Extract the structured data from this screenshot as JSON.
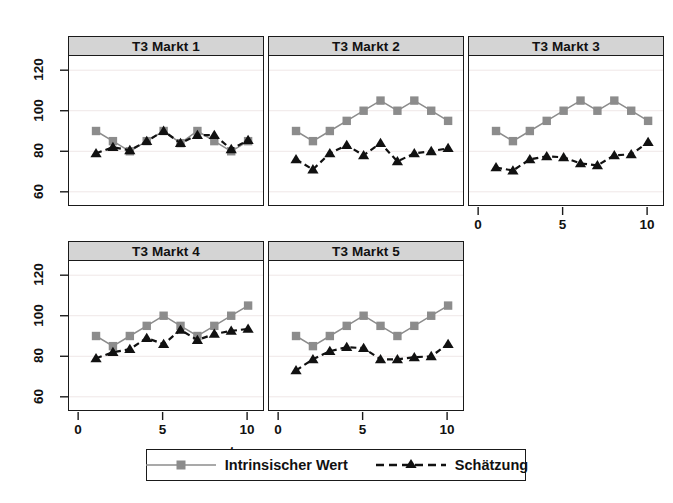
{
  "figure": {
    "xlabel": "t",
    "background": "#ffffff",
    "strip_fill": "#d4d4d4",
    "frame_color": "#1a1a1a"
  },
  "axis": {
    "y_ticks": [
      60,
      80,
      100,
      120
    ],
    "y_tick_labels": [
      "60",
      "80",
      "100",
      "120"
    ],
    "x_ticks": [
      0,
      5,
      10
    ],
    "x_tick_labels": [
      "0",
      "5",
      "10"
    ],
    "ylim": [
      53,
      127
    ],
    "xlim": [
      -0.6,
      11.0
    ]
  },
  "legend": {
    "items": [
      {
        "label": "Intrinsischer Wert",
        "marker": "square-marker",
        "line": "solid",
        "color": "#8c8c8c"
      },
      {
        "label": "Schätzung",
        "marker": "triangle-marker",
        "line": "dashed",
        "color": "#111111"
      }
    ]
  },
  "chart_data": {
    "type": "line",
    "title": "",
    "xlabel": "t",
    "ylabel": "",
    "xlim": [
      -0.6,
      11.0
    ],
    "ylim": [
      53,
      127
    ],
    "grid": true,
    "legend_position": "bottom",
    "x": [
      1,
      2,
      3,
      4,
      5,
      6,
      7,
      8,
      9,
      10
    ],
    "panels": [
      {
        "title": "T3 Markt 1",
        "series": [
          {
            "name": "Intrinsischer Wert",
            "color": "#8c8c8c",
            "marker": "square-marker",
            "line": "solid",
            "values": [
              90,
              85,
              80,
              85,
              90,
              84,
              90,
              85,
              80,
              85
            ]
          },
          {
            "name": "Schätzung",
            "color": "#111111",
            "marker": "triangle-marker",
            "line": "dashed",
            "values": [
              79,
              82,
              80.5,
              85,
              90,
              84,
              88,
              88,
              81,
              85.5
            ]
          }
        ]
      },
      {
        "title": "T3 Markt 2",
        "series": [
          {
            "name": "Intrinsischer Wert",
            "color": "#8c8c8c",
            "marker": "square-marker",
            "line": "solid",
            "values": [
              90,
              85,
              90,
              95,
              100,
              105,
              100,
              105,
              100,
              95
            ]
          },
          {
            "name": "Schätzung",
            "color": "#111111",
            "marker": "triangle-marker",
            "line": "dashed",
            "values": [
              76,
              71,
              79,
              83,
              78,
              84,
              75,
              79,
              80,
              81.5
            ]
          }
        ]
      },
      {
        "title": "T3 Markt 3",
        "series": [
          {
            "name": "Intrinsischer Wert",
            "color": "#8c8c8c",
            "marker": "square-marker",
            "line": "solid",
            "values": [
              90,
              85,
              90,
              95,
              100,
              105,
              100,
              105,
              100,
              95
            ]
          },
          {
            "name": "Schätzung",
            "color": "#111111",
            "marker": "triangle-marker",
            "line": "dashed",
            "values": [
              72,
              70.5,
              76,
              77.5,
              77,
              74,
              73,
              78,
              78.5,
              84.5
            ]
          }
        ]
      },
      {
        "title": "T3 Markt 4",
        "series": [
          {
            "name": "Intrinsischer Wert",
            "color": "#8c8c8c",
            "marker": "square-marker",
            "line": "solid",
            "values": [
              90,
              85,
              90,
              95,
              100,
              95,
              90,
              95,
              100,
              105
            ]
          },
          {
            "name": "Schätzung",
            "color": "#111111",
            "marker": "triangle-marker",
            "line": "dashed",
            "values": [
              79,
              82,
              83.5,
              89,
              86,
              93,
              88,
              91,
              92.5,
              93.5
            ]
          }
        ]
      },
      {
        "title": "T3 Markt 5",
        "series": [
          {
            "name": "Intrinsischer Wert",
            "color": "#8c8c8c",
            "marker": "square-marker",
            "line": "solid",
            "values": [
              90,
              85,
              90,
              95,
              100,
              95,
              90,
              95,
              100,
              105
            ]
          },
          {
            "name": "Schätzung",
            "color": "#111111",
            "marker": "triangle-marker",
            "line": "dashed",
            "values": [
              73,
              78.5,
              82.5,
              84.5,
              84,
              78.5,
              78.5,
              79.5,
              80,
              86
            ]
          }
        ]
      }
    ]
  }
}
